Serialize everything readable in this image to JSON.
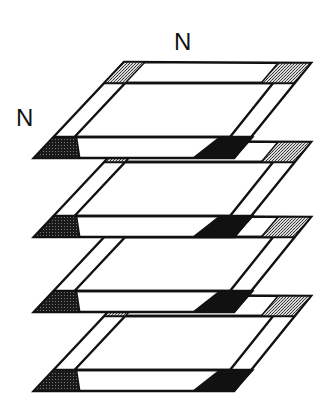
{
  "diagram": {
    "labels": {
      "top": "N",
      "left": "N"
    },
    "layer_count": 4,
    "layers": [
      {
        "index": 1,
        "top_y": 62
      },
      {
        "index": 2,
        "top_y": 141
      },
      {
        "index": 3,
        "top_y": 216
      },
      {
        "index": 4,
        "top_y": 295
      }
    ],
    "colors": {
      "stroke": "#111111",
      "fill": "#ffffff",
      "dark_patch": "#111111",
      "stipple_dark": "#2a2a2a",
      "stipple_light": "#9a9a9a",
      "background": "#ffffff"
    }
  }
}
